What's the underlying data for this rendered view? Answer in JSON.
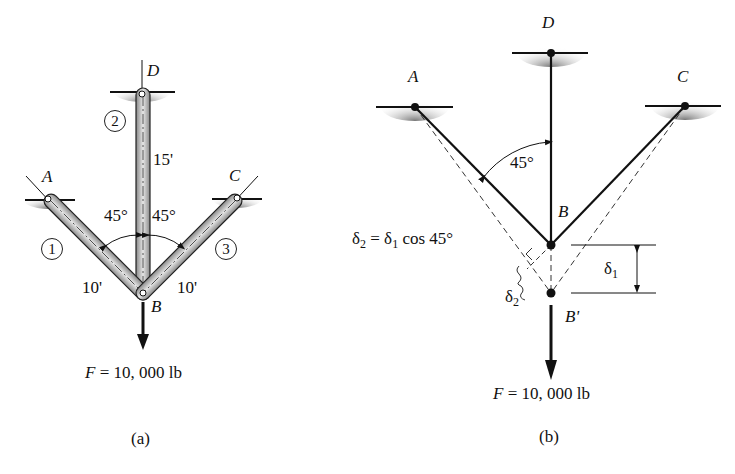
{
  "figure_a": {
    "caption": "(a)",
    "points": {
      "A": "A",
      "B": "B",
      "C": "C",
      "D": "D"
    },
    "members": [
      {
        "id": "1",
        "label": "1",
        "length": "10'"
      },
      {
        "id": "2",
        "label": "2",
        "length": "15'"
      },
      {
        "id": "3",
        "label": "3",
        "length": "10'"
      }
    ],
    "angles": {
      "left": "45°",
      "right": "45°"
    },
    "force": {
      "symbol": "F",
      "equals": " = 10, 000 lb"
    }
  },
  "figure_b": {
    "caption": "(b)",
    "points": {
      "A": "A",
      "B": "B",
      "B_prime": "B'",
      "C": "C",
      "D": "D"
    },
    "angle": "45°",
    "equation": {
      "lhs": "δ",
      "lhs_sub": "2",
      "mid": " = δ",
      "mid_sub": "1",
      "rhs": " cos 45°"
    },
    "delta1": {
      "sym": "δ",
      "sub": "1"
    },
    "delta2": {
      "sym": "δ",
      "sub": "2"
    },
    "force": {
      "symbol": "F",
      "equals": " = 10, 000 lb"
    }
  },
  "colors": {
    "ink": "#111111",
    "member_fill": "#b8b8b8",
    "shade": "#9a9a9a"
  }
}
